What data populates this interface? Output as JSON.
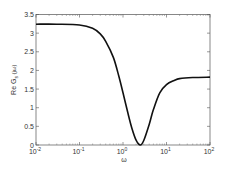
{
  "chart_data": {
    "type": "line",
    "title": "",
    "xlabel": "ω",
    "ylabel": "Re G_s(jω)",
    "ylabel_main": "Re G",
    "ylabel_sub": "s",
    "ylabel_tail": "(jω)",
    "xscale": "log",
    "xlim": [
      0.01,
      100
    ],
    "ylim": [
      0,
      3.5
    ],
    "grid": false,
    "legend": null,
    "x_ticks": [
      0.01,
      0.1,
      1,
      10,
      100
    ],
    "x_tick_labels": [
      {
        "base": "10",
        "exp": "-2"
      },
      {
        "base": "10",
        "exp": "-1"
      },
      {
        "base": "10",
        "exp": "0"
      },
      {
        "base": "10",
        "exp": "1"
      },
      {
        "base": "10",
        "exp": "2"
      }
    ],
    "y_ticks": [
      0,
      0.5,
      1,
      1.5,
      2,
      2.5,
      3,
      3.5
    ],
    "y_tick_labels": [
      "0",
      "0.5",
      "1",
      "1.5",
      "2",
      "2.5",
      "3",
      "3.5"
    ],
    "series": [
      {
        "name": "Re G_s(jω)",
        "color": "#111111",
        "x": [
          0.01,
          0.03,
          0.1,
          0.2,
          0.3,
          0.4,
          0.6,
          0.8,
          1.0,
          1.3,
          1.6,
          2.0,
          2.5,
          3.0,
          4.0,
          5.0,
          7.0,
          10,
          15,
          20,
          40,
          100
        ],
        "y": [
          3.24,
          3.24,
          3.22,
          3.13,
          2.98,
          2.78,
          2.35,
          1.85,
          1.4,
          0.85,
          0.45,
          0.13,
          0.0,
          0.12,
          0.55,
          0.95,
          1.4,
          1.62,
          1.73,
          1.78,
          1.81,
          1.82
        ]
      }
    ]
  }
}
